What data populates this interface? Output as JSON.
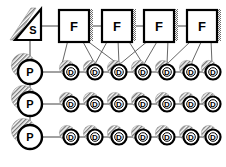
{
  "diagram": {
    "background_color": "#ffffff",
    "stroke_color": "#000000",
    "edge_color": "#444444",
    "shadow_color": "#8a8a8a",
    "source": {
      "shape": "triangle",
      "label": "S",
      "x": 30,
      "y": 25
    },
    "f_nodes": [
      {
        "label": "F",
        "x": 74,
        "y": 26
      },
      {
        "label": "F",
        "x": 117,
        "y": 26
      },
      {
        "label": "F",
        "x": 159,
        "y": 26
      },
      {
        "label": "F",
        "x": 202,
        "y": 26
      }
    ],
    "p_nodes": [
      {
        "label": "P",
        "x": 30,
        "y": 72
      },
      {
        "label": "P",
        "x": 30,
        "y": 104
      },
      {
        "label": "P",
        "x": 30,
        "y": 137
      }
    ],
    "d_rows": [
      {
        "row": 1,
        "y": 72,
        "nodes": [
          {
            "label": "D",
            "x": 71
          },
          {
            "label": "D",
            "x": 95
          },
          {
            "label": "D",
            "x": 119
          },
          {
            "label": "D",
            "x": 143
          },
          {
            "label": "D",
            "x": 167
          },
          {
            "label": "D",
            "x": 191
          },
          {
            "label": "D",
            "x": 213
          }
        ]
      },
      {
        "row": 2,
        "y": 104,
        "nodes": [
          {
            "label": "D",
            "x": 71
          },
          {
            "label": "D",
            "x": 95
          },
          {
            "label": "D",
            "x": 119
          },
          {
            "label": "D",
            "x": 143
          },
          {
            "label": "D",
            "x": 167
          },
          {
            "label": "D",
            "x": 191
          },
          {
            "label": "D",
            "x": 213
          }
        ]
      },
      {
        "row": 3,
        "y": 137,
        "nodes": [
          {
            "label": "D",
            "x": 71
          },
          {
            "label": "D",
            "x": 95
          },
          {
            "label": "D",
            "x": 119
          },
          {
            "label": "D",
            "x": 143
          },
          {
            "label": "D",
            "x": 167
          },
          {
            "label": "D",
            "x": 191
          },
          {
            "label": "D",
            "x": 213
          }
        ]
      }
    ],
    "legend": {
      "s_meaning": "S",
      "f_meaning": "F",
      "p_meaning": "P",
      "d_meaning": "D"
    }
  }
}
